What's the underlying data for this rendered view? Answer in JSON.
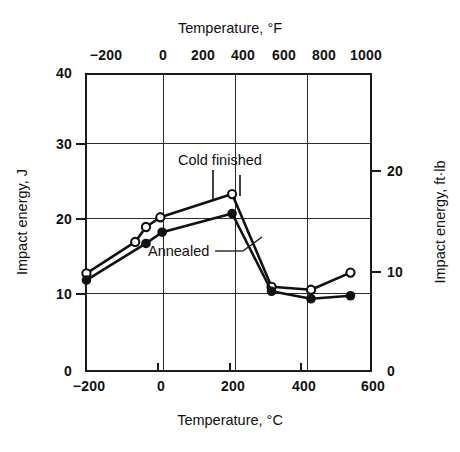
{
  "chart_data": {
    "type": "line",
    "title": "",
    "xlabel": "Temperature, °C",
    "xlabel_secondary": "Temperature, °F",
    "ylabel": "Impact energy, J",
    "ylabel_secondary": "Impact energy, ft·lb",
    "xlim": [
      -200,
      600
    ],
    "ylim": [
      0,
      40
    ],
    "xlim_secondary": [
      -328,
      1112
    ],
    "ylim_secondary": [
      0,
      29.5
    ],
    "xticks": [
      -200,
      0,
      200,
      400,
      600
    ],
    "xticklabels": [
      "−200",
      "0",
      "200",
      "400",
      "600"
    ],
    "yticks": [
      0,
      10,
      20,
      30,
      40
    ],
    "yticklabels": [
      "0",
      "10",
      "20",
      "30",
      "40"
    ],
    "xticks_secondary": [
      -200,
      0,
      200,
      400,
      600,
      800,
      1000
    ],
    "xticklabels_secondary": [
      "−200",
      "0",
      "200",
      "400",
      "600",
      "800",
      "1000"
    ],
    "yticks_secondary": [
      0,
      10,
      20
    ],
    "yticklabels_secondary": [
      "0",
      "10",
      "20"
    ],
    "grid": true,
    "grid_axis": "both",
    "legend_position": "inline-annotation",
    "annotations": [
      {
        "text": "Cold finished",
        "points_to_series": "Cold finished"
      },
      {
        "text": "Annealed",
        "points_to_series": "Annealed"
      }
    ],
    "series": [
      {
        "name": "Cold finished",
        "marker": "open-circle",
        "x": [
          -196,
          -60,
          -30,
          10,
          210,
          320,
          430,
          540
        ],
        "y": [
          13.2,
          17.4,
          19.4,
          20.7,
          23.8,
          11.4,
          11.0,
          13.3
        ]
      },
      {
        "name": "Annealed",
        "marker": "filled-circle",
        "x": [
          -196,
          -30,
          15,
          210,
          320,
          430,
          540
        ],
        "y": [
          12.3,
          17.2,
          18.7,
          21.2,
          10.8,
          9.8,
          10.2
        ]
      }
    ]
  },
  "axes": {
    "top": {
      "title": "Temperature, °F",
      "ticklabels": [
        "−200",
        "0",
        "200",
        "400",
        "600",
        "800",
        "1000"
      ]
    },
    "bottom": {
      "title": "Temperature, °C",
      "ticklabels": [
        "−200",
        "0",
        "200",
        "400",
        "600"
      ]
    },
    "left": {
      "title": "Impact energy, J",
      "ticklabels": [
        "40",
        "30",
        "20",
        "10",
        "0"
      ]
    },
    "right": {
      "title": "Impact energy, ft·lb",
      "ticklabels": [
        "20",
        "10",
        "0"
      ]
    }
  },
  "labels": {
    "cold_finished": "Cold finished",
    "annealed": "Annealed"
  },
  "colors": {
    "line": "#111111",
    "axis": "#1a1a1a",
    "grid": "#2b2b2b",
    "background": "#ffffff",
    "marker_open_fill": "#ffffff"
  }
}
